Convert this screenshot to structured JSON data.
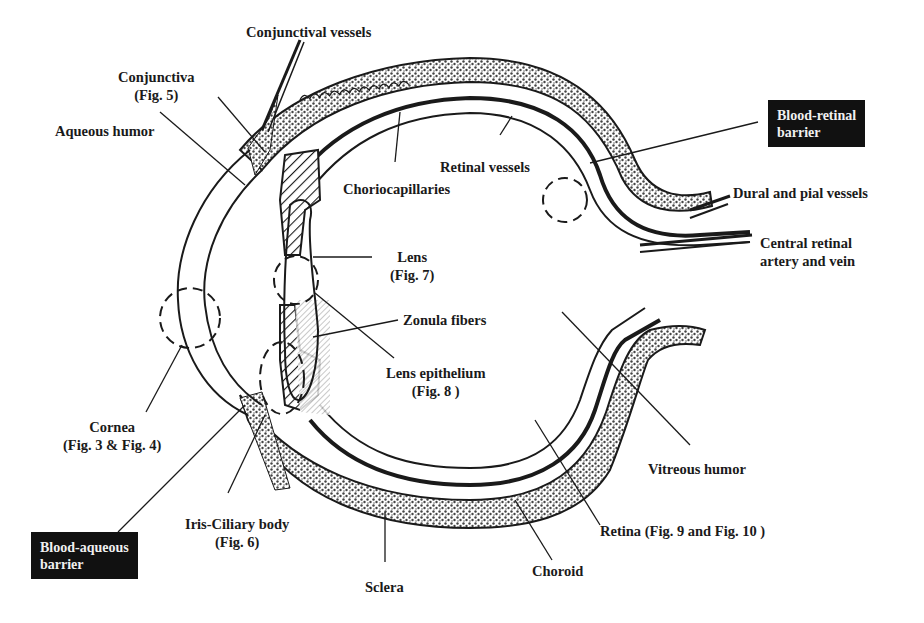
{
  "diagram": {
    "type": "anatomical cross-section of the eye",
    "colors": {
      "ink": "#1a1a1a",
      "stipple_fill": "#8a8a8a",
      "box_bg": "#111111",
      "box_text": "#f0f0f0"
    },
    "labels": {
      "conjunctival_vessels": "Conjunctival vessels",
      "conjunctiva": "Conjunctiva",
      "conjunctiva_fig": "(Fig. 5)",
      "aqueous_humor": "Aqueous humor",
      "choriocapillaries": "Choriocapillaries",
      "retinal_vessels": "Retinal vessels",
      "blood_retinal_barrier_1": "Blood-retinal",
      "blood_retinal_barrier_2": "barrier",
      "dural_pial_vessels": "Dural and pial vessels",
      "central_retinal_1": "Central retinal",
      "central_retinal_2": "artery and vein",
      "lens": "Lens",
      "lens_fig": "(Fig. 7)",
      "zonula_fibers": "Zonula fibers",
      "lens_epithelium": "Lens epithelium",
      "lens_epithelium_fig": "(Fig. 8 )",
      "cornea": "Cornea",
      "cornea_fig": "(Fig. 3 & Fig. 4)",
      "vitreous_humor": "Vitreous humor",
      "iris_ciliary": "Iris-Ciliary body",
      "iris_ciliary_fig": "(Fig. 6)",
      "blood_aqueous_barrier_1": "Blood-aqueous",
      "blood_aqueous_barrier_2": "barrier",
      "retina": "Retina (Fig. 9 and Fig. 10 )",
      "choroid": "Choroid",
      "sclera": "Sclera"
    }
  }
}
